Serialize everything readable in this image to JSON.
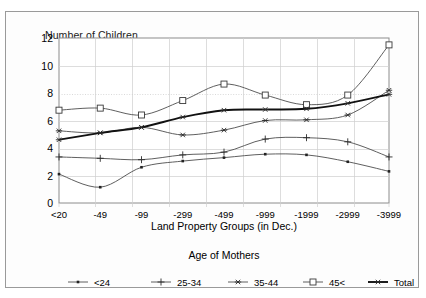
{
  "chart_data": {
    "type": "line",
    "title": "Number of Children",
    "xlabel": "Land Property Groups (in Dec.)",
    "ylabel": "Number of Children",
    "legend_title": "Age of Mothers",
    "legend_position": "bottom",
    "grid": true,
    "ylim": [
      0,
      12
    ],
    "yticks": [
      0,
      2,
      4,
      6,
      8,
      10,
      12
    ],
    "categories": [
      "<20",
      "-49",
      "-99",
      "-299",
      "-499",
      "-999",
      "-1999",
      "-2999",
      "-3999"
    ],
    "series": [
      {
        "name": "<24",
        "marker": "small-dot",
        "values": [
          2.1,
          1.15,
          2.6,
          3.05,
          3.3,
          3.55,
          3.5,
          3.0,
          2.3
        ]
      },
      {
        "name": "25-34",
        "marker": "plus",
        "values": [
          3.35,
          3.25,
          3.15,
          3.5,
          3.7,
          4.65,
          4.75,
          4.45,
          3.35
        ]
      },
      {
        "name": "35-44",
        "marker": "asterisk",
        "values": [
          5.25,
          5.1,
          5.5,
          4.95,
          5.3,
          6.0,
          6.05,
          6.4,
          8.2
        ]
      },
      {
        "name": "45<",
        "marker": "open-square",
        "values": [
          6.75,
          6.9,
          6.4,
          7.45,
          8.65,
          7.85,
          7.15,
          7.85,
          11.5
        ]
      },
      {
        "name": "Total",
        "marker": "asterisk-bold",
        "values": [
          4.6,
          5.1,
          5.5,
          6.25,
          6.75,
          6.8,
          6.85,
          7.25,
          7.9
        ]
      }
    ]
  },
  "legend": {
    "title": "Age of Mothers",
    "items": [
      {
        "label": "<24"
      },
      {
        "label": "25-34"
      },
      {
        "label": "35-44"
      },
      {
        "label": "45<"
      },
      {
        "label": "Total"
      }
    ]
  }
}
